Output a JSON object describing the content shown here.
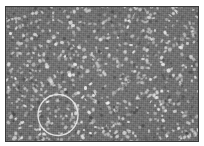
{
  "figure": {
    "kind": "grayscale-micrograph",
    "caption": "",
    "background_color": "#6f6f6f",
    "feature_color": "#d2d2d2",
    "frame_color": "#3a3a3a",
    "page_color": "#ffffff"
  },
  "frame": {
    "x": 5,
    "y": 6,
    "width": 194,
    "height": 136,
    "border_width": 1
  },
  "annotations": [
    {
      "id": "roi-circle",
      "shape": "circle",
      "label": "",
      "stroke_color": "#e8e8e8",
      "stroke_width": 1.4,
      "center_x": 52,
      "center_y": 108,
      "radius_x": 20,
      "radius_y": 20.5
    }
  ],
  "chart_data": {
    "type": "heatmap",
    "title": "",
    "xlabel": "",
    "ylabel": "",
    "colormap": "grayscale",
    "background_level": 111,
    "feature_level": 210,
    "feature_count": 760,
    "grid": false,
    "legend": false,
    "xlim": [
      0,
      194
    ],
    "ylim": [
      0,
      136
    ]
  }
}
